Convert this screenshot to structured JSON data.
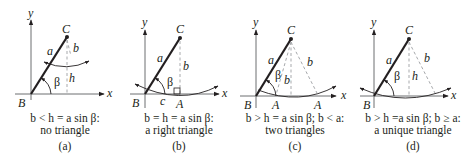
{
  "figure": {
    "panels": [
      {
        "id": "a",
        "labels": {
          "y_axis": "y",
          "x_axis": "x",
          "vertex_B": "B",
          "vertex_C": "C",
          "side_a": "a",
          "side_b": "b",
          "height_h": "h",
          "angle": "β"
        },
        "caption_line1": "b < h = a sin β:",
        "caption_line2": "no triangle",
        "panel_label": "(a)"
      },
      {
        "id": "b",
        "labels": {
          "y_axis": "y",
          "x_axis": "x",
          "vertex_B": "B",
          "vertex_C": "C",
          "vertex_A": "A",
          "side_a": "a",
          "side_b": "b",
          "side_c": "c",
          "angle": "β"
        },
        "caption_line1": "b = h = a sin β:",
        "caption_line2": "a right triangle",
        "panel_label": "(b)"
      },
      {
        "id": "c",
        "labels": {
          "y_axis": "y",
          "x_axis": "x",
          "vertex_B": "B",
          "vertex_C": "C",
          "vertex_A1": "A",
          "vertex_A2": "A",
          "side_a": "a",
          "side_b1": "b",
          "side_b2": "b",
          "angle": "β"
        },
        "caption_line1": "b > h = a sin β; b < a:",
        "caption_line2": "two triangles",
        "panel_label": "(c)"
      },
      {
        "id": "d",
        "labels": {
          "y_axis": "y",
          "x_axis": "x",
          "vertex_B": "B",
          "vertex_C": "C",
          "side_a": "a",
          "side_b": "b",
          "height_h": "h",
          "angle": "β"
        },
        "caption_line1": "b > h =a sin β; b ≥ a:",
        "caption_line2": "a unique triangle",
        "panel_label": "(d)"
      }
    ]
  }
}
